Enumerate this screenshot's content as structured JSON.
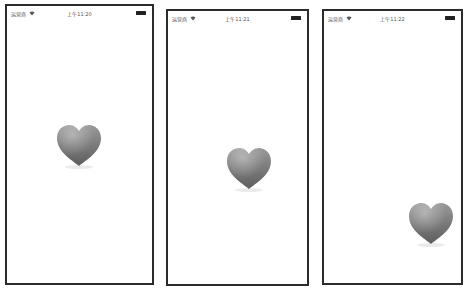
{
  "screens": [
    {
      "status_bar": {
        "carrier": "运营商",
        "wifi_icon": "wifi-icon",
        "time": "上午11:20",
        "battery_icon": "battery-icon"
      },
      "heart": {
        "icon": "heart-icon",
        "color": "#7a7a7a"
      }
    },
    {
      "status_bar": {
        "carrier": "运营商",
        "wifi_icon": "wifi-icon",
        "time": "上午11:21",
        "battery_icon": "battery-icon"
      },
      "heart": {
        "icon": "heart-icon",
        "color": "#7a7a7a"
      }
    },
    {
      "status_bar": {
        "carrier": "运营商",
        "wifi_icon": "wifi-icon",
        "time": "上午11:22",
        "battery_icon": "battery-icon"
      },
      "heart": {
        "icon": "heart-icon",
        "color": "#7a7a7a"
      }
    }
  ]
}
